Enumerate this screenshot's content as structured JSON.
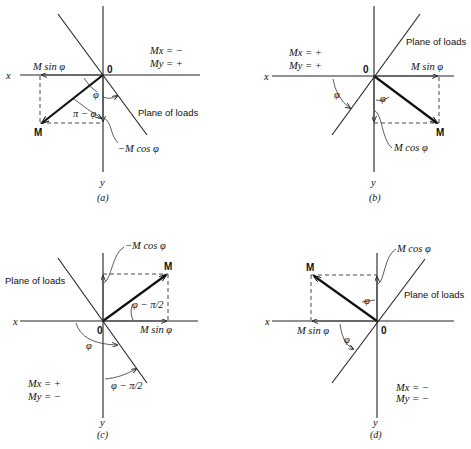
{
  "figure": {
    "panels": [
      {
        "id": "a",
        "caption": "(a)",
        "axis_x": "x",
        "axis_y": "y",
        "origin": "0",
        "point": "M",
        "sign_mx": "Mx = −",
        "sign_my": "My = +",
        "plane_label": "Plane of loads",
        "comp_horizontal": "M sin φ",
        "comp_vertical": "−M cos φ",
        "angle_1": "φ",
        "angle_2": "π − φ"
      },
      {
        "id": "b",
        "caption": "(b)",
        "axis_x": "x",
        "axis_y": "y",
        "origin": "0",
        "point": "M",
        "sign_mx": "Mx = +",
        "sign_my": "My = +",
        "plane_label": "Plane of loads",
        "comp_horizontal": "M sin φ",
        "comp_vertical": "M cos φ",
        "angle_1": "φ",
        "angle_2": "φ"
      },
      {
        "id": "c",
        "caption": "(c)",
        "axis_x": "x",
        "axis_y": "y",
        "origin": "0",
        "point": "M",
        "sign_mx": "Mx = +",
        "sign_my": "My = −",
        "plane_label": "Plane of loads",
        "comp_horizontal": "M sin φ",
        "comp_vertical": "−M cos φ",
        "angle_1": "φ",
        "angle_2": "φ − π/2",
        "angle_3": "φ − π/2"
      },
      {
        "id": "d",
        "caption": "(d)",
        "axis_x": "x",
        "axis_y": "y",
        "origin": "0",
        "point": "M",
        "sign_mx": "Mx = −",
        "sign_my": "My = −",
        "plane_label": "Plane of loads",
        "comp_horizontal": "M sin φ",
        "comp_vertical": "M cos φ",
        "angle_1": "φ",
        "angle_2": "φ"
      }
    ]
  }
}
